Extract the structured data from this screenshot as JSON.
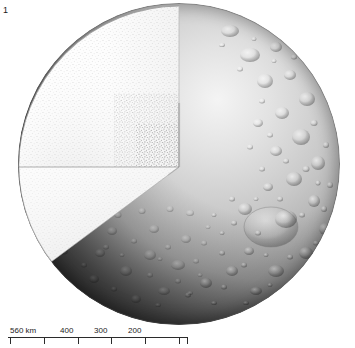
{
  "figure": {
    "number": "1",
    "caption_text": ""
  },
  "scale_bar": {
    "unit_label": "km",
    "labels": [
      {
        "text": "560 km",
        "value": 560,
        "x_px": 2
      },
      {
        "text": "400",
        "value": 400,
        "x_px": 52
      },
      {
        "text": "300",
        "value": 300,
        "x_px": 86
      },
      {
        "text": "200",
        "value": 200,
        "x_px": 120
      }
    ],
    "ticks_px": [
      2,
      36,
      70,
      103,
      137,
      171,
      179
    ],
    "tick_values": [
      560,
      500,
      400,
      300,
      200,
      100,
      0
    ],
    "length_px": 180,
    "color": "#2b2b2b"
  },
  "sphere": {
    "center_x": 179,
    "center_y": 164,
    "radius": 161,
    "cut_vertical_x": 181,
    "cut_horizontal_y": 193,
    "surface_description": "heavily cratered icy crust",
    "interior_description": "pale stippled interior cross-section",
    "colors": {
      "interior_light": "#fbfbfb",
      "interior_stipple": "#8d8d8d",
      "crust_light": "#ededed",
      "crust_mid": "#b4b4b4",
      "crust_dark": "#3a3a3a",
      "shadow": "#141414",
      "outline": "#6e6e6e",
      "ink": "#1c1c1c"
    }
  },
  "craters": {
    "count_visible": 118,
    "large_basin": {
      "cx": 271,
      "cy": 242,
      "rx": 27,
      "ry": 20
    }
  }
}
